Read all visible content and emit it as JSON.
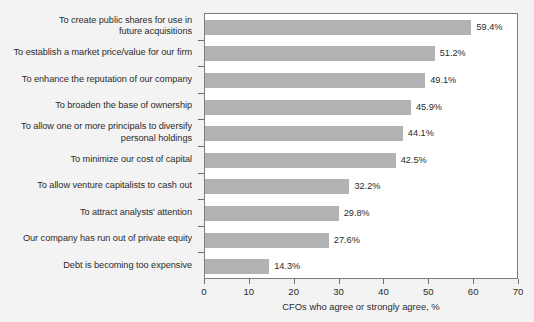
{
  "chart_data": {
    "type": "bar",
    "orientation": "horizontal",
    "title": "",
    "subtitle": "",
    "xlabel": "CFOs who agree or strongly agree, %",
    "ylabel": "",
    "xlim": [
      0,
      70
    ],
    "xticks": [
      0,
      10,
      20,
      30,
      40,
      50,
      60,
      70
    ],
    "xtick_labels": [
      "0",
      "10",
      "20",
      "30",
      "40",
      "50",
      "60",
      "70"
    ],
    "grid": false,
    "legend": null,
    "bar_color": "#b2b2b2",
    "categories": [
      "To create public shares for use in future acquisitions",
      "To establish a market price/value for our firm",
      "To enhance the reputation of our company",
      "To broaden the base of ownership",
      "To allow one or more principals to diversify personal holdings",
      "To minimize our cost of capital",
      "To allow venture capitalists to cash out",
      "To attract analysts' attention",
      "Our company has run out of private equity",
      "Debt is becoming too expensive"
    ],
    "category_lines": [
      [
        "To create public shares for use in",
        "future acquisitions"
      ],
      [
        "To establish a market price/value for our firm"
      ],
      [
        "To enhance the reputation of our company"
      ],
      [
        "To broaden the base of ownership"
      ],
      [
        "To allow one or more principals to diversify",
        "personal holdings"
      ],
      [
        "To minimize our cost of capital"
      ],
      [
        "To allow venture capitalists to cash out"
      ],
      [
        "To attract analysts' attention"
      ],
      [
        "Our company has run out of private equity"
      ],
      [
        "Debt is becoming too expensive"
      ]
    ],
    "values": [
      59.4,
      51.2,
      49.1,
      45.9,
      44.1,
      42.5,
      32.2,
      29.8,
      27.6,
      14.3
    ],
    "value_labels": [
      "59.4%",
      "51.2%",
      "49.1%",
      "45.9%",
      "44.1%",
      "42.5%",
      "32.2%",
      "29.8%",
      "27.6%",
      "14.3%"
    ]
  }
}
